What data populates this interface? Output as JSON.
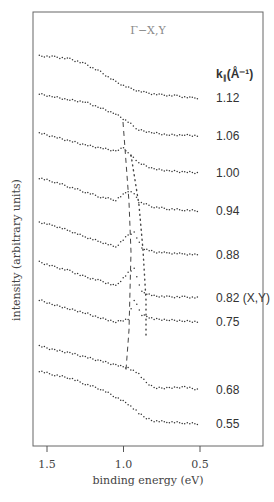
{
  "chart_data": {
    "type": "line",
    "title": "Γ−X,Y",
    "xlabel": "binding energy (eV)",
    "ylabel": "intensity (arbitrary units)",
    "xlim": [
      1.6,
      0.4
    ],
    "x_reversed": true,
    "xticks": [
      1.5,
      1.0,
      0.5
    ],
    "xtick_labels": [
      "1.5",
      "1.0",
      "0.5"
    ],
    "grid": false,
    "legend": {
      "title": "k∥ (Å⁻¹)",
      "position": "right"
    },
    "series": [
      {
        "name": "1.12",
        "label": "1.12",
        "offset_y": 56,
        "points": [
          [
            1.55,
            0
          ],
          [
            1.45,
            1
          ],
          [
            1.35,
            3
          ],
          [
            1.25,
            8
          ],
          [
            1.15,
            16
          ],
          [
            1.05,
            26
          ],
          [
            0.95,
            33
          ],
          [
            0.85,
            37
          ],
          [
            0.75,
            39
          ],
          [
            0.65,
            40
          ],
          [
            0.55,
            42
          ],
          [
            0.5,
            42
          ]
        ]
      },
      {
        "name": "1.06",
        "label": "1.06",
        "offset_y": 94,
        "points": [
          [
            1.55,
            0
          ],
          [
            1.45,
            3
          ],
          [
            1.35,
            6
          ],
          [
            1.25,
            8
          ],
          [
            1.15,
            14
          ],
          [
            1.05,
            20
          ],
          [
            0.97,
            28
          ],
          [
            0.9,
            36
          ],
          [
            0.8,
            39
          ],
          [
            0.7,
            41
          ],
          [
            0.6,
            41
          ],
          [
            0.5,
            42
          ]
        ]
      },
      {
        "name": "1.00",
        "label": "1.00",
        "offset_y": 133,
        "points": [
          [
            1.55,
            0
          ],
          [
            1.45,
            4
          ],
          [
            1.35,
            8
          ],
          [
            1.25,
            12
          ],
          [
            1.15,
            15
          ],
          [
            1.05,
            18
          ],
          [
            1.0,
            15
          ],
          [
            0.97,
            20
          ],
          [
            0.9,
            30
          ],
          [
            0.8,
            36
          ],
          [
            0.7,
            38
          ],
          [
            0.6,
            39
          ],
          [
            0.5,
            40
          ]
        ]
      },
      {
        "name": "0.94",
        "label": "0.94",
        "offset_y": 178,
        "points": [
          [
            1.55,
            0
          ],
          [
            1.45,
            4
          ],
          [
            1.35,
            9
          ],
          [
            1.25,
            14
          ],
          [
            1.15,
            19
          ],
          [
            1.05,
            22
          ],
          [
            0.97,
            13
          ],
          [
            0.93,
            15
          ],
          [
            0.9,
            24
          ],
          [
            0.8,
            29
          ],
          [
            0.7,
            31
          ],
          [
            0.6,
            32
          ],
          [
            0.5,
            33
          ]
        ]
      },
      {
        "name": "0.88",
        "label": "0.88",
        "offset_y": 222,
        "points": [
          [
            1.55,
            0
          ],
          [
            1.45,
            4
          ],
          [
            1.35,
            9
          ],
          [
            1.25,
            15
          ],
          [
            1.15,
            20
          ],
          [
            1.05,
            25
          ],
          [
            0.97,
            13
          ],
          [
            0.93,
            10
          ],
          [
            0.88,
            26
          ],
          [
            0.8,
            30
          ],
          [
            0.7,
            31
          ],
          [
            0.6,
            32
          ],
          [
            0.5,
            33
          ]
        ]
      },
      {
        "name": "0.82",
        "label": "0.82 (X,Y)",
        "offset_y": 262,
        "points": [
          [
            1.55,
            0
          ],
          [
            1.45,
            5
          ],
          [
            1.35,
            9
          ],
          [
            1.25,
            15
          ],
          [
            1.15,
            19
          ],
          [
            1.05,
            24
          ],
          [
            0.97,
            11
          ],
          [
            0.93,
            7
          ],
          [
            0.88,
            30
          ],
          [
            0.8,
            34
          ],
          [
            0.7,
            35
          ],
          [
            0.6,
            35
          ],
          [
            0.5,
            36
          ]
        ]
      },
      {
        "name": "0.75",
        "label": "0.75",
        "offset_y": 300,
        "points": [
          [
            1.55,
            0
          ],
          [
            1.45,
            5
          ],
          [
            1.35,
            9
          ],
          [
            1.25,
            13
          ],
          [
            1.15,
            18
          ],
          [
            1.05,
            22
          ],
          [
            0.97,
            19
          ],
          [
            0.93,
            0
          ],
          [
            0.88,
            15
          ],
          [
            0.8,
            19
          ],
          [
            0.7,
            20
          ],
          [
            0.6,
            21
          ],
          [
            0.5,
            22
          ]
        ]
      },
      {
        "name": "0.68",
        "label": "0.68",
        "offset_y": 346,
        "points": [
          [
            1.55,
            0
          ],
          [
            1.45,
            4
          ],
          [
            1.35,
            7
          ],
          [
            1.25,
            11
          ],
          [
            1.15,
            15
          ],
          [
            1.05,
            19
          ],
          [
            0.97,
            22
          ],
          [
            0.9,
            28
          ],
          [
            0.85,
            37
          ],
          [
            0.8,
            42
          ],
          [
            0.7,
            42
          ],
          [
            0.6,
            41
          ],
          [
            0.5,
            44
          ]
        ]
      },
      {
        "name": "0.55",
        "label": "0.55",
        "offset_y": 371,
        "points": [
          [
            1.55,
            0
          ],
          [
            1.45,
            4
          ],
          [
            1.35,
            7
          ],
          [
            1.25,
            13
          ],
          [
            1.15,
            18
          ],
          [
            1.05,
            26
          ],
          [
            0.97,
            33
          ],
          [
            0.9,
            42
          ],
          [
            0.85,
            47
          ],
          [
            0.8,
            50
          ],
          [
            0.7,
            51
          ],
          [
            0.6,
            52
          ],
          [
            0.5,
            53
          ]
        ]
      }
    ],
    "annotations": [
      {
        "type": "dashed-line",
        "description": "peak dispersion guide",
        "from": [
          0.97,
          1.06
        ],
        "to": [
          0.98,
          0.68
        ]
      },
      {
        "type": "dotted-line",
        "description": "secondary peak guide",
        "from": [
          0.94,
          1.0
        ],
        "to": [
          0.89,
          0.68
        ]
      }
    ]
  },
  "labels": {
    "title": "Γ−X,Y",
    "legend_title_k": "k",
    "legend_title_sub": "∥",
    "legend_title_unit": "(Å⁻¹)",
    "xlabel": "binding energy (eV)",
    "ylabel": "intensity (arbitrary units)"
  }
}
